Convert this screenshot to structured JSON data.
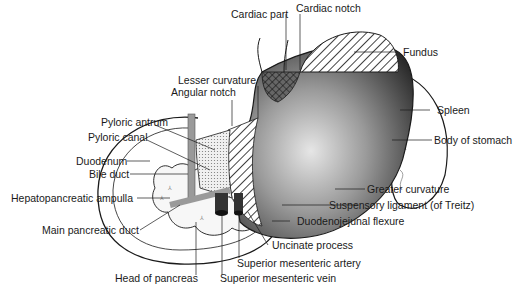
{
  "diagram": {
    "labels": {
      "cardiac_part": "Cardiac part",
      "cardiac_notch": "Cardiac notch",
      "fundus": "Fundus",
      "lesser_curvature": "Lesser curvature",
      "angular_notch": "Angular notch",
      "spleen": "Spleen",
      "pyloric_antrum": "Pyloric antrum",
      "pyloric_canal": "Pyloric canal",
      "body_of_stomach": "Body of stomach",
      "duodenum": "Duodenum",
      "bile_duct": "Bile duct",
      "hepatopancreatic_ampulla": "Hepatopancreatic ampulla",
      "greater_curvature": "Greater curvature",
      "suspensory_ligament": "Suspensory ligament (of Treitz)",
      "duodenojejunal_flexure": "Duodenojejunal flexure",
      "main_pancreatic_duct": "Main pancreatic duct",
      "uncinate_process": "Uncinate process",
      "superior_mesenteric_artery": "Superior mesenteric artery",
      "head_of_pancreas": "Head of pancreas",
      "superior_mesenteric_vein": "Superior mesenteric vein"
    },
    "colors": {
      "outline": "#1a1a1a",
      "stomach_dark": "#2b2b2b",
      "stomach_light": "#d8d8d8",
      "hatch": "#444444",
      "pancreas_fill": "#f4f4f4",
      "duct": "#9a9a9a"
    }
  }
}
